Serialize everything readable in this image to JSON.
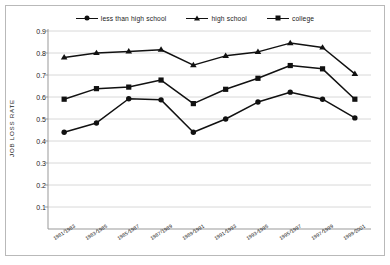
{
  "chart_data": {
    "type": "line",
    "title": "",
    "subtitle": "",
    "xlabel": "",
    "ylabel": "JOB LOSS RATE",
    "ylim": [
      0,
      0.9
    ],
    "yticks": [
      0.1,
      0.2,
      0.3,
      0.4,
      0.5,
      0.6,
      0.7,
      0.8,
      0.9
    ],
    "ytick_labels": [
      "0.1",
      "0.2",
      "0.3",
      "0.4",
      "0.5",
      "0.6",
      "0.7",
      "0.8",
      "0.9"
    ],
    "grid": true,
    "grid_axis": "y",
    "legend_position": "top-center",
    "categories": [
      "1981-1983",
      "1983-1985",
      "1985-1987",
      "1987-1989",
      "1989-1991",
      "1991-1993",
      "1993-1995",
      "1995-1997",
      "1997-1999",
      "1999-2001"
    ],
    "series": [
      {
        "name": "less than high school",
        "marker": "circle",
        "color": "#111111",
        "values": [
          0.44,
          0.482,
          0.592,
          0.587,
          0.44,
          0.5,
          0.577,
          0.622,
          0.59,
          0.505
        ]
      },
      {
        "name": "high school",
        "marker": "triangle",
        "color": "#111111",
        "values": [
          0.78,
          0.8,
          0.807,
          0.815,
          0.745,
          0.787,
          0.805,
          0.845,
          0.825,
          0.705
        ]
      },
      {
        "name": "college",
        "marker": "square",
        "color": "#111111",
        "values": [
          0.59,
          0.638,
          0.645,
          0.677,
          0.57,
          0.635,
          0.685,
          0.743,
          0.728,
          0.59
        ]
      }
    ]
  },
  "legend": {
    "items": [
      {
        "label": "less than high school",
        "marker": "circle"
      },
      {
        "label": "high school",
        "marker": "triangle"
      },
      {
        "label": "college",
        "marker": "square"
      }
    ]
  },
  "colors": {
    "line": "#111111",
    "grid": "#d8d8d8",
    "axis": "#999999",
    "frame": "#b9b9b9",
    "background": "#ffffff",
    "text": "#1a1a1a"
  }
}
